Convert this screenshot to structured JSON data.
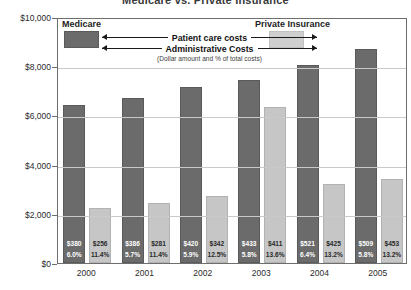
{
  "chart": {
    "title": "Medicare vs. Private Insurance"
  },
  "legend": {
    "medicare_label": "Medicare",
    "private_label": "Private Insurance",
    "row1_label": "Patient care costs",
    "row2_label": "Administrative Costs",
    "note": "(Dollar amount and % of total costs)",
    "medicare_color": "#6b6b6b",
    "private_color": "#cfcfcf"
  },
  "chart_data": {
    "type": "bar",
    "title": "Medicare vs. Private Insurance",
    "xlabel": "",
    "ylabel": "",
    "ylim": [
      0,
      10000
    ],
    "yticks": [
      0,
      2000,
      4000,
      6000,
      8000,
      10000
    ],
    "ytick_labels": [
      "$0",
      "$2,000",
      "$4,000",
      "$6,000",
      "$8,000",
      "$10,000"
    ],
    "grid": true,
    "legend_position": "inside-top",
    "categories": [
      "2000",
      "2001",
      "2002",
      "2003",
      "2004",
      "2005"
    ],
    "series": [
      {
        "name": "Medicare",
        "color": "#6b6b6b",
        "values": [
          6420,
          6720,
          7150,
          7450,
          8060,
          8720
        ],
        "admin_amount": [
          "$380",
          "$386",
          "$420",
          "$433",
          "$521",
          "$509"
        ],
        "admin_percent": [
          "6.0%",
          "5.7%",
          "5.9%",
          "5.8%",
          "6.4%",
          "5.8%"
        ]
      },
      {
        "name": "Private Insurance",
        "color": "#c6c6c6",
        "values": [
          2230,
          2440,
          2740,
          6350,
          3200,
          3420
        ],
        "admin_amount": [
          "$256",
          "$281",
          "$342",
          "$411",
          "$425",
          "$453"
        ],
        "admin_percent": [
          "11.4%",
          "11.4%",
          "12.5%",
          "13.6%",
          "13.2%",
          "13.2%"
        ]
      }
    ]
  }
}
